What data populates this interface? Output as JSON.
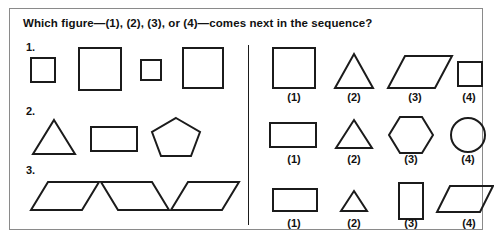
{
  "question": {
    "title": "Which figure—(1), (2), (3), or (4)—comes next in the sequence?"
  },
  "colors": {
    "card_border": "#8a8a8a",
    "shape_stroke": "#1b1b1b",
    "divider": "#1b1b1b",
    "text": "#111111",
    "background": "#ffffff"
  },
  "sequences": [
    {
      "number": "1.",
      "shapes": [
        {
          "name": "small-square",
          "kind": "square"
        },
        {
          "name": "large-square",
          "kind": "square"
        },
        {
          "name": "small-square",
          "kind": "square"
        },
        {
          "name": "large-square",
          "kind": "square"
        }
      ]
    },
    {
      "number": "2.",
      "shapes": [
        {
          "name": "triangle",
          "kind": "triangle"
        },
        {
          "name": "rectangle",
          "kind": "rectangle"
        },
        {
          "name": "pentagon",
          "kind": "pentagon"
        }
      ]
    },
    {
      "number": "3.",
      "shapes": [
        {
          "name": "parallelogram-right",
          "kind": "parallelogram"
        },
        {
          "name": "parallelogram-left",
          "kind": "parallelogram"
        },
        {
          "name": "parallelogram-right",
          "kind": "parallelogram"
        }
      ]
    }
  ],
  "option_rows": [
    {
      "row": 1,
      "options": [
        {
          "label": "(1)",
          "shape": "large-square"
        },
        {
          "label": "(2)",
          "shape": "triangle"
        },
        {
          "label": "(3)",
          "shape": "parallelogram-right"
        },
        {
          "label": "(4)",
          "shape": "small-square"
        }
      ]
    },
    {
      "row": 2,
      "options": [
        {
          "label": "(1)",
          "shape": "rectangle"
        },
        {
          "label": "(2)",
          "shape": "triangle"
        },
        {
          "label": "(3)",
          "shape": "hexagon"
        },
        {
          "label": "(4)",
          "shape": "circle"
        }
      ]
    },
    {
      "row": 3,
      "options": [
        {
          "label": "(1)",
          "shape": "wide-rectangle"
        },
        {
          "label": "(2)",
          "shape": "small-triangle"
        },
        {
          "label": "(3)",
          "shape": "tall-rectangle"
        },
        {
          "label": "(4)",
          "shape": "parallelogram-left"
        }
      ]
    }
  ]
}
